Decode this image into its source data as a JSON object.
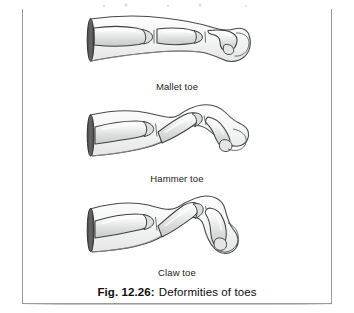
{
  "figure": {
    "caption_number": "Fig. 12.26:",
    "caption_text": "Deformities of toes",
    "frame_color": "#9a9a9a",
    "background_color": "#ffffff"
  },
  "panels": [
    {
      "id": "mallet",
      "label": "Mallet toe",
      "description": "Lateral line drawing of a toe: proximal and middle phalanges held straight, distal phalanx flexed downward at the distal interphalangeal joint."
    },
    {
      "id": "hammer",
      "label": "Hammer toe",
      "description": "Lateral line drawing of a toe: proximal phalanx extended upward, middle phalanx acutely flexed downward at the proximal interphalangeal joint, distal phalanx roughly level."
    },
    {
      "id": "claw",
      "label": "Claw toe",
      "description": "Lateral line drawing of a toe: proximal phalanx hyperextended upward, with both interphalangeal joints flexed so the toe curls sharply downward like a claw."
    }
  ],
  "art_style": {
    "bone_fill": "#e9eaea",
    "bone_highlight": "#fbfbfb",
    "bone_shadow": "#c3c6c6",
    "soft_tissue_fill": "#f4f5f5",
    "outline_color": "#3a3a3a",
    "cut_end_color": "#5a5a5a"
  }
}
